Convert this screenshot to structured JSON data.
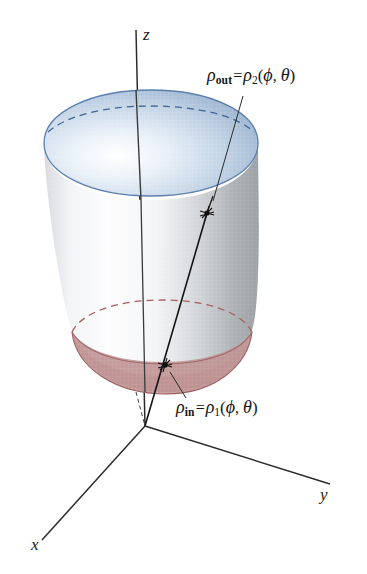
{
  "figure": {
    "background_color": "#ffffff"
  },
  "axes": {
    "z_label": "z",
    "y_label": "y",
    "x_label": "x",
    "axis_color": "#2b2b2b"
  },
  "annotations": {
    "outer": {
      "lhs_symbol": "ρ",
      "lhs_sub": "out",
      "equals": "=",
      "rhs_symbol": "ρ",
      "rhs_sub": "2",
      "open_paren": "(",
      "arg1": "ϕ",
      "comma": ",",
      "arg2": "θ",
      "close_paren": ")"
    },
    "inner": {
      "lhs_symbol": "ρ",
      "lhs_sub": "in",
      "equals": "=",
      "rhs_symbol": "ρ",
      "rhs_sub": "1",
      "open_paren": "(",
      "arg1": "ϕ",
      "comma": ",",
      "arg2": "θ",
      "close_paren": ")"
    }
  },
  "solid": {
    "top_surface_color": "#b7cade",
    "top_rim_color": "#5b7fae",
    "lateral_surface_color": "#cfd2d5",
    "lateral_shadow_color": "#9fa3a7",
    "bottom_surface_color": "#c09494",
    "bottom_rim_color": "#9c5f5f",
    "dashed_back_edge_blue": "#3f6596",
    "dashed_back_edge_red": "#a85f5f",
    "ray_color": "#1a1a1a",
    "marker_style": "star-burst"
  }
}
